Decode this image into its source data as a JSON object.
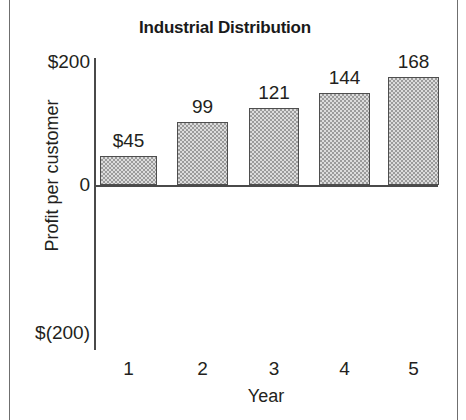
{
  "chart_data": {
    "type": "bar",
    "title": "Industrial Distribution",
    "xlabel": "Year",
    "ylabel": "Profit per customer",
    "categories": [
      "1",
      "2",
      "3",
      "4",
      "5"
    ],
    "values": [
      45,
      99,
      121,
      144,
      168
    ],
    "value_labels": [
      "$45",
      "99",
      "121",
      "144",
      "168"
    ],
    "ytick_labels": [
      "$200",
      "0",
      "$(200)"
    ],
    "ytick_values": [
      200,
      0,
      -200
    ],
    "ylim": [
      -200,
      200
    ],
    "grid": false,
    "legend": false,
    "bar_color": "#c9c9c9",
    "bar_border_color": "#4e4e4e",
    "axis_color": "#4a4a4a",
    "text_color": "#231f20"
  }
}
